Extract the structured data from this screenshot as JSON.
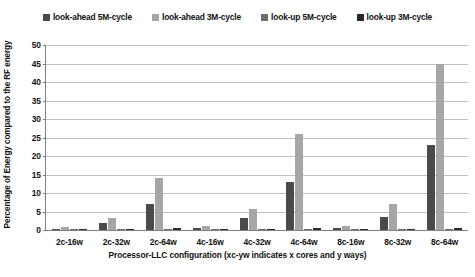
{
  "chart_data": {
    "type": "bar",
    "title": "",
    "xlabel": "Processor-LLC configuration  (xc-yw indicates x cores and y ways)",
    "ylabel": "Percentage of Energy compared to the RF energy",
    "categories": [
      "2c-16w",
      "2c-32w",
      "2c-64w",
      "4c-16w",
      "4c-32w",
      "4c-64w",
      "8c-16w",
      "8c-32w",
      "8c-64w"
    ],
    "ylim": [
      0,
      50
    ],
    "yticks": [
      0,
      5,
      10,
      15,
      20,
      25,
      30,
      35,
      40,
      45,
      50
    ],
    "grid": true,
    "legend_position": "top",
    "series": [
      {
        "name": "look-ahead 5M-cycle",
        "color": "#4a4a4a",
        "values": [
          0.4,
          2.0,
          7.0,
          0.5,
          3.2,
          13.0,
          0.6,
          3.5,
          23.0
        ]
      },
      {
        "name": "look-ahead 3M-cycle",
        "color": "#a6a6a6",
        "values": [
          0.7,
          3.2,
          14.0,
          1.0,
          5.8,
          26.0,
          1.2,
          7.0,
          45.0
        ]
      },
      {
        "name": "look-up 5M-cycle",
        "color": "#6e6e6e",
        "values": [
          0.15,
          0.2,
          0.3,
          0.15,
          0.2,
          0.3,
          0.15,
          0.25,
          0.4
        ]
      },
      {
        "name": "look-up 3M-cycle",
        "color": "#2b2b2b",
        "values": [
          0.2,
          0.3,
          0.45,
          0.2,
          0.3,
          0.45,
          0.2,
          0.35,
          0.6
        ]
      }
    ]
  }
}
